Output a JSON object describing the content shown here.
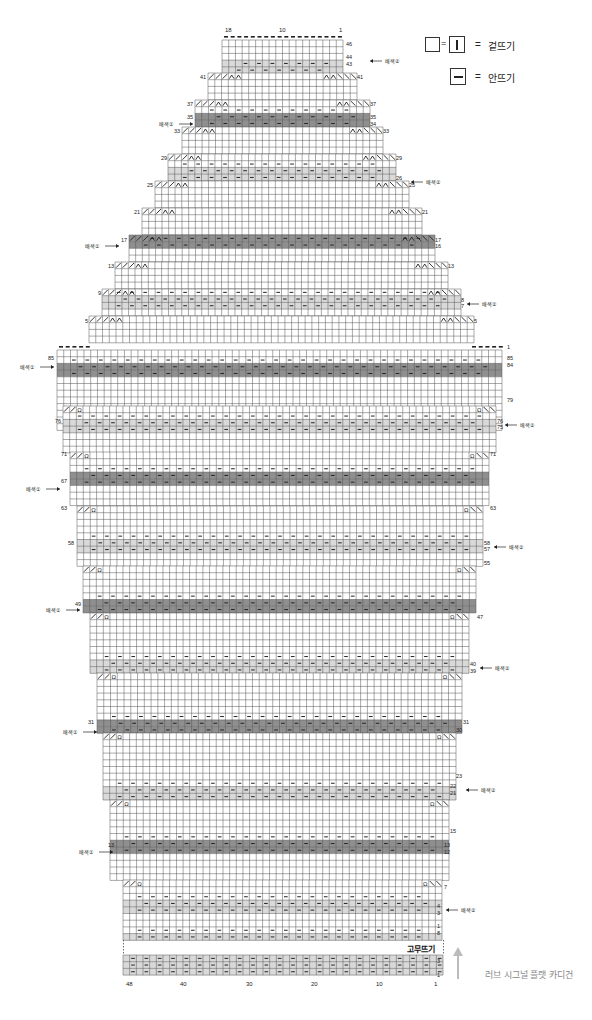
{
  "legend": {
    "items": [
      {
        "symbol": "empty-square = vertical-bar-square",
        "eq": "=",
        "label": "겉뜨기"
      },
      {
        "symbol": "horizontal-bar-square",
        "eq": "=",
        "label": "안뜨기"
      }
    ]
  },
  "caption": "러브 시그널 플랫 카디건",
  "ribbing_label": "고무뜨기",
  "color_labels": {
    "color1": "배색①",
    "color2": "배색②"
  },
  "colors": {
    "dark_band": "#8f8f8f",
    "light_band": "#d9d9d9",
    "grid": "#555555",
    "bg": "#ffffff"
  },
  "top_col_labels": [
    {
      "text": "18",
      "x": 225
    },
    {
      "text": "10",
      "x": 279
    },
    {
      "text": "1",
      "x": 339
    }
  ],
  "bottom_col_labels": [
    {
      "text": "48",
      "x": 126
    },
    {
      "text": "40",
      "x": 180
    },
    {
      "text": "30",
      "x": 246
    },
    {
      "text": "20",
      "x": 311
    },
    {
      "text": "10",
      "x": 376
    },
    {
      "text": "1",
      "x": 434
    }
  ],
  "row_labels": [
    {
      "t": "46",
      "x": 346,
      "y": 41
    },
    {
      "t": "44",
      "x": 346,
      "y": 54
    },
    {
      "t": "43",
      "x": 346,
      "y": 61
    },
    {
      "t": "41",
      "x": 200,
      "y": 74
    },
    {
      "t": "41",
      "x": 357,
      "y": 74
    },
    {
      "t": "37",
      "x": 187,
      "y": 101
    },
    {
      "t": "37",
      "x": 370,
      "y": 101
    },
    {
      "t": "35",
      "x": 187,
      "y": 114
    },
    {
      "t": "35",
      "x": 370,
      "y": 114
    },
    {
      "t": "34",
      "x": 370,
      "y": 121
    },
    {
      "t": "33",
      "x": 174,
      "y": 128
    },
    {
      "t": "33",
      "x": 383,
      "y": 128
    },
    {
      "t": "29",
      "x": 161,
      "y": 155
    },
    {
      "t": "29",
      "x": 396,
      "y": 155
    },
    {
      "t": "26",
      "x": 396,
      "y": 175
    },
    {
      "t": "25",
      "x": 147,
      "y": 182
    },
    {
      "t": "25",
      "x": 409,
      "y": 182
    },
    {
      "t": "21",
      "x": 134,
      "y": 209
    },
    {
      "t": "21",
      "x": 422,
      "y": 209
    },
    {
      "t": "17",
      "x": 121,
      "y": 237
    },
    {
      "t": "17",
      "x": 435,
      "y": 237
    },
    {
      "t": "16",
      "x": 435,
      "y": 243
    },
    {
      "t": "13",
      "x": 108,
      "y": 263
    },
    {
      "t": "13",
      "x": 448,
      "y": 263
    },
    {
      "t": "9",
      "x": 98,
      "y": 290
    },
    {
      "t": "8",
      "x": 461,
      "y": 297
    },
    {
      "t": "7",
      "x": 461,
      "y": 303
    },
    {
      "t": "5",
      "x": 85,
      "y": 318
    },
    {
      "t": "5",
      "x": 474,
      "y": 318
    },
    {
      "t": "1",
      "x": 507,
      "y": 344
    },
    {
      "t": "85",
      "x": 48,
      "y": 355
    },
    {
      "t": "85",
      "x": 507,
      "y": 355
    },
    {
      "t": "84",
      "x": 507,
      "y": 362
    },
    {
      "t": "79",
      "x": 507,
      "y": 397
    },
    {
      "t": "76",
      "x": 55,
      "y": 418
    },
    {
      "t": "76",
      "x": 497,
      "y": 418
    },
    {
      "t": "75",
      "x": 497,
      "y": 424
    },
    {
      "t": "71",
      "x": 61,
      "y": 451
    },
    {
      "t": "71",
      "x": 490,
      "y": 451
    },
    {
      "t": "67",
      "x": 61,
      "y": 478
    },
    {
      "t": "63",
      "x": 61,
      "y": 505
    },
    {
      "t": "63",
      "x": 490,
      "y": 505
    },
    {
      "t": "58",
      "x": 68,
      "y": 540
    },
    {
      "t": "58",
      "x": 484,
      "y": 540
    },
    {
      "t": "57",
      "x": 484,
      "y": 546
    },
    {
      "t": "55",
      "x": 484,
      "y": 560
    },
    {
      "t": "49",
      "x": 75,
      "y": 601
    },
    {
      "t": "47",
      "x": 477,
      "y": 614
    },
    {
      "t": "40",
      "x": 470,
      "y": 661
    },
    {
      "t": "39",
      "x": 470,
      "y": 668
    },
    {
      "t": "31",
      "x": 88,
      "y": 719
    },
    {
      "t": "31",
      "x": 463,
      "y": 719
    },
    {
      "t": "30",
      "x": 456,
      "y": 727
    },
    {
      "t": "23",
      "x": 456,
      "y": 773
    },
    {
      "t": "22",
      "x": 450,
      "y": 783
    },
    {
      "t": "21",
      "x": 450,
      "y": 790
    },
    {
      "t": "15",
      "x": 450,
      "y": 828
    },
    {
      "t": "13",
      "x": 108,
      "y": 842
    },
    {
      "t": "13",
      "x": 444,
      "y": 842
    },
    {
      "t": "12",
      "x": 444,
      "y": 849
    },
    {
      "t": "7",
      "x": 444,
      "y": 884
    },
    {
      "t": "4",
      "x": 437,
      "y": 903
    },
    {
      "t": "3",
      "x": 437,
      "y": 910
    },
    {
      "t": "1",
      "x": 437,
      "y": 923
    },
    {
      "t": "8",
      "x": 437,
      "y": 930
    },
    {
      "t": "3",
      "x": 437,
      "y": 958
    },
    {
      "t": "1",
      "x": 437,
      "y": 972
    }
  ],
  "color_markers": [
    {
      "t": "배색②",
      "x": 370,
      "y": 61,
      "side": "right"
    },
    {
      "t": "배색①",
      "x": 193,
      "y": 124,
      "side": "left"
    },
    {
      "t": "배색②",
      "x": 411,
      "y": 182,
      "side": "right"
    },
    {
      "t": "배색①",
      "x": 119,
      "y": 246,
      "side": "left"
    },
    {
      "t": "배색②",
      "x": 467,
      "y": 304,
      "side": "right"
    },
    {
      "t": "배색①",
      "x": 54,
      "y": 367,
      "side": "left"
    },
    {
      "t": "배색②",
      "x": 505,
      "y": 425,
      "side": "right"
    },
    {
      "t": "배색①",
      "x": 60,
      "y": 489,
      "side": "left"
    },
    {
      "t": "배색②",
      "x": 494,
      "y": 547,
      "side": "right"
    },
    {
      "t": "배색①",
      "x": 80,
      "y": 610,
      "side": "left"
    },
    {
      "t": "배색②",
      "x": 480,
      "y": 668,
      "side": "right"
    },
    {
      "t": "배색①",
      "x": 97,
      "y": 732,
      "side": "left"
    },
    {
      "t": "배색②",
      "x": 466,
      "y": 790,
      "side": "right"
    },
    {
      "t": "배색①",
      "x": 113,
      "y": 852,
      "side": "left"
    },
    {
      "t": "배색②",
      "x": 446,
      "y": 910,
      "side": "right"
    }
  ],
  "grid_blocks": [
    {
      "name": "yoke-top",
      "x0": 222,
      "x1": 343,
      "y0": 40,
      "rows": [
        "w",
        "w",
        "w",
        "l1",
        "l2",
        "l1",
        "w",
        "w"
      ]
    },
    {
      "name": "yoke-41",
      "x0": 208,
      "x1": 357,
      "y0": 73,
      "rows": [
        "w",
        "w",
        "w",
        "w"
      ]
    },
    {
      "name": "yoke-37",
      "x0": 195,
      "x1": 370,
      "y0": 100,
      "rows": [
        "w",
        "p",
        "d1",
        "d2"
      ]
    },
    {
      "name": "yoke-33",
      "x0": 182,
      "x1": 383,
      "y0": 127,
      "rows": [
        "w",
        "w",
        "w",
        "w"
      ]
    },
    {
      "name": "yoke-29",
      "x0": 168,
      "x1": 396,
      "y0": 154,
      "rows": [
        "w",
        "p",
        "l1",
        "l2"
      ]
    },
    {
      "name": "yoke-25",
      "x0": 155,
      "x1": 409,
      "y0": 181,
      "rows": [
        "w",
        "w",
        "w",
        "w"
      ]
    },
    {
      "name": "yoke-21",
      "x0": 142,
      "x1": 422,
      "y0": 208,
      "rows": [
        "w",
        "w",
        "w",
        "w"
      ]
    },
    {
      "name": "yoke-17",
      "x0": 129,
      "x1": 435,
      "y0": 235,
      "rows": [
        "d1",
        "d2",
        "w",
        "w"
      ]
    },
    {
      "name": "yoke-13",
      "x0": 115,
      "x1": 448,
      "y0": 262,
      "rows": [
        "w",
        "w",
        "w",
        "w"
      ]
    },
    {
      "name": "yoke-9",
      "x0": 102,
      "x1": 461,
      "y0": 289,
      "rows": [
        "p",
        "l1",
        "l2",
        "w"
      ]
    },
    {
      "name": "yoke-5",
      "x0": 89,
      "x1": 474,
      "y0": 316,
      "rows": [
        "w",
        "w",
        "w",
        "w"
      ]
    },
    {
      "name": "body-top",
      "x0": 57,
      "x1": 502,
      "y0": 350,
      "rows": [
        "w",
        "p",
        "d1",
        "d2",
        "w",
        "w",
        "w",
        "w",
        "w",
        "w",
        "w",
        "w"
      ]
    },
    {
      "name": "body-79",
      "x0": 63,
      "x1": 496,
      "y0": 406,
      "rows": [
        "w",
        "p",
        "l1",
        "l2",
        "w",
        "w",
        "w"
      ]
    },
    {
      "name": "body-71",
      "x0": 70,
      "x1": 489,
      "y0": 452,
      "rows": [
        "w",
        "w",
        "p",
        "d1",
        "d2",
        "w",
        "w",
        "w"
      ]
    },
    {
      "name": "body-63",
      "x0": 77,
      "x1": 483,
      "y0": 506,
      "rows": [
        "w",
        "w",
        "w",
        "w",
        "p",
        "l1",
        "l2",
        "w",
        "w"
      ]
    },
    {
      "name": "body-55",
      "x0": 83,
      "x1": 476,
      "y0": 566,
      "rows": [
        "w",
        "w",
        "w",
        "w",
        "p",
        "d1",
        "d2"
      ]
    },
    {
      "name": "body-47",
      "x0": 90,
      "x1": 469,
      "y0": 613,
      "rows": [
        "w",
        "w",
        "w",
        "w",
        "w",
        "w",
        "p",
        "l1",
        "l2"
      ]
    },
    {
      "name": "body-39",
      "x0": 97,
      "x1": 462,
      "y0": 673,
      "rows": [
        "w",
        "w",
        "w",
        "w",
        "w",
        "w",
        "p",
        "d1",
        "d2"
      ]
    },
    {
      "name": "body-31",
      "x0": 103,
      "x1": 456,
      "y0": 733,
      "rows": [
        "w",
        "w",
        "w",
        "w",
        "w",
        "w",
        "w",
        "p",
        "l1",
        "l2"
      ]
    },
    {
      "name": "body-23",
      "x0": 110,
      "x1": 449,
      "y0": 800,
      "rows": [
        "w",
        "w",
        "w",
        "w",
        "w",
        "p",
        "d1",
        "d2",
        "w",
        "w",
        "w",
        "w"
      ]
    },
    {
      "name": "body-7",
      "x0": 123,
      "x1": 442,
      "y0": 880,
      "rows": [
        "w",
        "w",
        "p",
        "l1",
        "l2",
        "w",
        "w",
        "p2",
        "l2b"
      ]
    },
    {
      "name": "rib",
      "x0": 123,
      "x1": 443,
      "y0": 955,
      "rows": [
        "r",
        "r",
        "r"
      ]
    }
  ]
}
